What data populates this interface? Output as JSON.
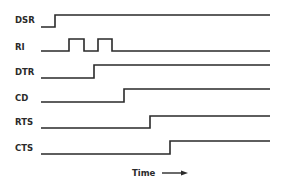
{
  "diagram": {
    "type": "timing-diagram",
    "x_axis_label": "Time",
    "x_axis_arrow": "right-arrow",
    "line_color": "#2a2a2a",
    "background": "#ffffff",
    "signals": [
      {
        "name": "DSR",
        "initial": "low",
        "transitions": [
          "rise"
        ],
        "description": "rises early"
      },
      {
        "name": "RI",
        "initial": "low",
        "transitions": [
          "rise",
          "fall",
          "rise",
          "fall"
        ],
        "description": "two pulses"
      },
      {
        "name": "DTR",
        "initial": "low",
        "transitions": [
          "rise"
        ],
        "description": "rises after RI pulses"
      },
      {
        "name": "CD",
        "initial": "low",
        "transitions": [
          "rise"
        ],
        "description": "rises after DTR"
      },
      {
        "name": "RTS",
        "initial": "low",
        "transitions": [
          "rise"
        ],
        "description": "rises after CD"
      },
      {
        "name": "CTS",
        "initial": "low",
        "transitions": [
          "rise"
        ],
        "description": "rises after RTS"
      }
    ]
  }
}
